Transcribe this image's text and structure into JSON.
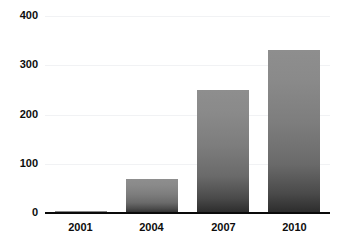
{
  "chart_data": {
    "type": "bar",
    "title": "",
    "xlabel": "",
    "ylabel": "",
    "categories": [
      "2001",
      "2004",
      "2007",
      "2010"
    ],
    "values": [
      4,
      70,
      250,
      330
    ],
    "series": [
      {
        "name": "",
        "values": [
          4,
          70,
          250,
          330
        ]
      }
    ],
    "ylim": [
      0,
      400
    ],
    "yticks": [
      0,
      100,
      200,
      300,
      400
    ],
    "ytick_labels": [
      "0",
      "100",
      "200",
      "300",
      "400"
    ],
    "grid": true,
    "legend": "none",
    "bar_color_top": "#8e8e8e",
    "bar_color_bottom": "#2b2b2b",
    "gridline_color": "#f1f2f4",
    "axis_color": "#0a0a0a",
    "label_color": "#0d0d0d",
    "background_color": "#ffffff"
  }
}
